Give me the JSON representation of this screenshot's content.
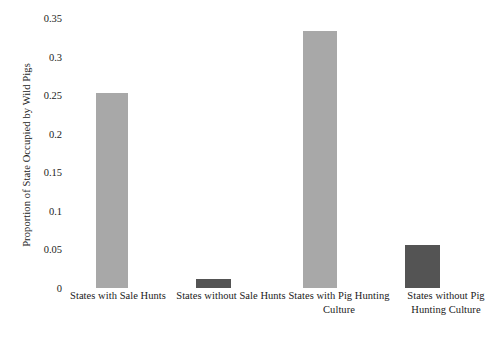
{
  "chart_data": {
    "type": "bar",
    "title": "",
    "subtitle": "",
    "xlabel": "",
    "ylabel": "Proportion of State Occupied by Wild Pigs",
    "ylim": [
      0,
      0.35
    ],
    "yticks": [
      "0",
      "0.05",
      "0.1",
      "0.15",
      "0.2",
      "0.25",
      "0.3",
      "0.35"
    ],
    "ytick_values": [
      0,
      0.05,
      0.1,
      0.15,
      0.2,
      0.25,
      0.3,
      0.35
    ],
    "grid": false,
    "legend": "none",
    "background_color": "#ffffff",
    "categories": [
      "States with Sale Hunts",
      "States without Sale Hunts",
      "States with Pig Hunting Culture",
      "States without Pig Hunting Culture"
    ],
    "values": [
      0.253,
      0.012,
      0.333,
      0.056
    ],
    "bar_colors": [
      "#a8a8a8",
      "#545454",
      "#a8a8a8",
      "#545454"
    ],
    "colors": {
      "light_gray": "#a8a8a8",
      "dark_gray": "#545454",
      "text": "#1a1a1a"
    }
  }
}
